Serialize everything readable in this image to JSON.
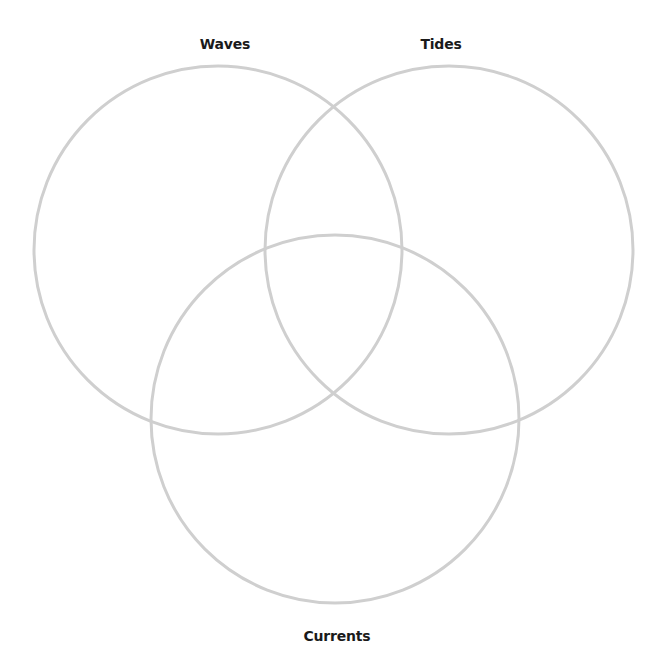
{
  "diagram": {
    "type": "venn",
    "stroke_color": "#cfcfcf",
    "label_color": "#1a1a1a",
    "sets": [
      {
        "label": "Waves",
        "cx": 218,
        "cy": 250,
        "r": 184,
        "label_x": 225,
        "label_y": 36
      },
      {
        "label": "Tides",
        "cx": 449,
        "cy": 250,
        "r": 184,
        "label_x": 441,
        "label_y": 36
      },
      {
        "label": "Currents",
        "cx": 335,
        "cy": 419,
        "r": 184,
        "label_x": 337,
        "label_y": 628
      }
    ]
  }
}
